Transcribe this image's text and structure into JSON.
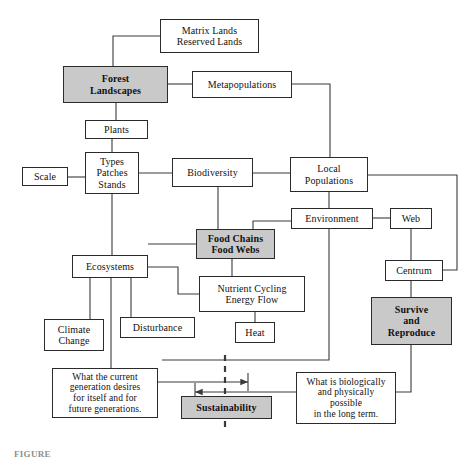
{
  "figure": {
    "caption_partial": "FIGURE",
    "colors": {
      "shaded_fill": "#c9c9c9",
      "plain_fill": "#ffffff",
      "line": "#3a3a3a",
      "border": "#2b2b2b",
      "text": "#111111"
    }
  },
  "nodes": [
    {
      "id": "matrix-lands",
      "label": "Matrix Lands\nReserved Lands",
      "shaded": false,
      "x": 160,
      "y": 19,
      "w": 99,
      "h": 34,
      "font": 10
    },
    {
      "id": "forest-landscapes",
      "label": "Forest\nLandscapes",
      "shaded": true,
      "x": 63,
      "y": 66,
      "w": 105,
      "h": 37,
      "font": 10
    },
    {
      "id": "metapopulations",
      "label": "Metapopulations",
      "shaded": false,
      "x": 192,
      "y": 71,
      "w": 100,
      "h": 27,
      "font": 10
    },
    {
      "id": "plants",
      "label": "Plants",
      "shaded": false,
      "x": 85,
      "y": 120,
      "w": 63,
      "h": 19,
      "font": 10
    },
    {
      "id": "types-patches-stands",
      "label": "Types\nPatches\nStands",
      "shaded": false,
      "x": 85,
      "y": 152,
      "w": 54,
      "h": 42,
      "font": 10
    },
    {
      "id": "scale",
      "label": "Scale",
      "shaded": false,
      "x": 22,
      "y": 167,
      "w": 46,
      "h": 19,
      "font": 10
    },
    {
      "id": "biodiversity",
      "label": "Biodiversity",
      "shaded": false,
      "x": 172,
      "y": 158,
      "w": 81,
      "h": 29,
      "font": 10
    },
    {
      "id": "local-populations",
      "label": "Local\nPopulations",
      "shaded": false,
      "x": 290,
      "y": 157,
      "w": 78,
      "h": 35,
      "font": 10
    },
    {
      "id": "environment",
      "label": "Environment",
      "shaded": false,
      "x": 291,
      "y": 208,
      "w": 82,
      "h": 21,
      "font": 10
    },
    {
      "id": "web",
      "label": "Web",
      "shaded": false,
      "x": 390,
      "y": 208,
      "w": 42,
      "h": 21,
      "font": 10
    },
    {
      "id": "centrum",
      "label": "Centrum",
      "shaded": false,
      "x": 385,
      "y": 260,
      "w": 58,
      "h": 21,
      "font": 10
    },
    {
      "id": "food-chains-webs",
      "label": "Food Chains\nFood Webs",
      "shaded": true,
      "x": 196,
      "y": 229,
      "w": 79,
      "h": 30,
      "font": 10
    },
    {
      "id": "ecosystems",
      "label": "Ecosystems",
      "shaded": false,
      "x": 72,
      "y": 255,
      "w": 76,
      "h": 23,
      "font": 10
    },
    {
      "id": "nutrient-cycling",
      "label": "Nutrient Cycling\nEnergy Flow",
      "shaded": false,
      "x": 199,
      "y": 276,
      "w": 106,
      "h": 36,
      "font": 10
    },
    {
      "id": "climate-change",
      "label": "Climate\nChange",
      "shaded": false,
      "x": 44,
      "y": 319,
      "w": 60,
      "h": 32,
      "font": 10
    },
    {
      "id": "disturbance",
      "label": "Disturbance",
      "shaded": false,
      "x": 120,
      "y": 317,
      "w": 75,
      "h": 21,
      "font": 10
    },
    {
      "id": "heat",
      "label": "Heat",
      "shaded": false,
      "x": 235,
      "y": 322,
      "w": 40,
      "h": 21,
      "font": 10
    },
    {
      "id": "survive-reproduce",
      "label": "Survive\nand\nReproduce",
      "shaded": true,
      "x": 371,
      "y": 297,
      "w": 81,
      "h": 48,
      "font": 10
    },
    {
      "id": "current-generation",
      "label": "What the current\ngeneration desires\nfor itself and for\nfuture generations.",
      "shaded": false,
      "x": 52,
      "y": 368,
      "w": 106,
      "h": 50,
      "font": 9.5
    },
    {
      "id": "biologically-possible",
      "label": "What is biologically\nand physically\npossible\nin the long term.",
      "shaded": false,
      "x": 296,
      "y": 372,
      "w": 100,
      "h": 52,
      "font": 9.5
    },
    {
      "id": "sustainability",
      "label": "Sustainability",
      "shaded": true,
      "x": 181,
      "y": 396,
      "w": 91,
      "h": 23,
      "font": 10
    }
  ],
  "connections": [
    {
      "id": "matrix-to-forest",
      "from": "matrix-lands",
      "to": "forest-landscapes",
      "path": "M160,36 L113,36 L113,66"
    },
    {
      "id": "forest-to-metapopulations",
      "from": "forest-landscapes",
      "to": "metapopulations",
      "path": "M168,84 L192,84"
    },
    {
      "id": "forest-to-plants",
      "from": "forest-landscapes",
      "to": "plants",
      "path": "M116,103 L116,120"
    },
    {
      "id": "plants-to-types",
      "from": "plants",
      "to": "types-patches-stands",
      "path": "M112,139 L112,152"
    },
    {
      "id": "scale-to-types",
      "from": "scale",
      "to": "types-patches-stands",
      "path": "M68,177 L85,177"
    },
    {
      "id": "types-to-biodiversity",
      "from": "types-patches-stands",
      "to": "biodiversity",
      "path": "M139,173 L172,173"
    },
    {
      "id": "metapop-to-local",
      "from": "metapopulations",
      "to": "local-populations",
      "path": "M292,84 L330,84 L330,157"
    },
    {
      "id": "biodiversity-to-local",
      "from": "biodiversity",
      "to": "local-populations",
      "path": "M253,173 L290,173"
    },
    {
      "id": "local-to-environment",
      "from": "local-populations",
      "to": "environment",
      "path": "M329,192 L329,208"
    },
    {
      "id": "environment-to-web",
      "from": "environment",
      "to": "web",
      "path": "M373,218 L390,218"
    },
    {
      "id": "web-to-centrum",
      "from": "web",
      "to": "centrum",
      "path": "M411,229 L411,260"
    },
    {
      "id": "local-to-centrum",
      "from": "local-populations",
      "to": "centrum",
      "path": "M368,175 L457,175 L457,270 L443,270"
    },
    {
      "id": "biodiversity-to-foodchains",
      "from": "biodiversity",
      "to": "food-chains-webs",
      "path": "M218,187 L218,229"
    },
    {
      "id": "environment-to-foodchains",
      "from": "environment",
      "to": "food-chains-webs",
      "path": "M291,221 L253,221 L253,229"
    },
    {
      "id": "ecosystems-to-foodchains",
      "from": "ecosystems",
      "to": "food-chains-webs",
      "path": "M148,244 L172,244 L172,244 L196,244"
    },
    {
      "id": "types-to-ecosystems",
      "from": "types-patches-stands",
      "to": "ecosystems",
      "path": "M112,194 L112,255"
    },
    {
      "id": "foodchains-to-nutrient",
      "from": "food-chains-webs",
      "to": "nutrient-cycling",
      "path": "M232,259 L232,276"
    },
    {
      "id": "ecosystems-to-nutrient",
      "from": "ecosystems",
      "to": "nutrient-cycling",
      "path": "M148,267 L178,267 L178,294 L199,294"
    },
    {
      "id": "nutrient-to-heat",
      "from": "nutrient-cycling",
      "to": "heat",
      "path": "M255,312 L255,322"
    },
    {
      "id": "ecosystems-to-climate",
      "from": "ecosystems",
      "to": "climate-change",
      "path": "M90,278 L90,319"
    },
    {
      "id": "ecosystems-to-disturbance",
      "from": "ecosystems",
      "to": "disturbance",
      "path": "M131,278 L131,317"
    },
    {
      "id": "ecosystems-to-current-gen",
      "from": "ecosystems",
      "to": "current-generation",
      "path": "M111,278 L111,368"
    },
    {
      "id": "environment-to-bottom-bus",
      "from": "environment",
      "to": "biologically-possible",
      "path": "M329,229 L329,360 L162,360"
    },
    {
      "id": "centrum-to-survive",
      "from": "centrum",
      "to": "survive-reproduce",
      "path": "M411,281 L411,297"
    },
    {
      "id": "survive-to-biological",
      "from": "survive-reproduce",
      "to": "biologically-possible",
      "path": "M411,345 L411,392 L396,392"
    },
    {
      "id": "current-gen-arrow",
      "from": "current-generation",
      "to": "sustainability-line",
      "path": "M158,382 L248,382"
    },
    {
      "id": "biological-arrow",
      "from": "biologically-possible",
      "to": "sustainability-line",
      "path": "M296,392 L195,392"
    }
  ],
  "dashed_axis": {
    "id": "sustainability-dashed-line",
    "x": 225,
    "y1": 355,
    "y2": 430
  },
  "arrow_ticks": [
    {
      "id": "tick-right",
      "x": 248,
      "y1": 373,
      "y2": 391
    },
    {
      "id": "tick-left",
      "x": 195,
      "y1": 383,
      "y2": 401
    }
  ]
}
